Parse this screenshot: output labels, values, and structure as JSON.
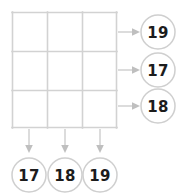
{
  "puzzle": {
    "grid": {
      "rows": 3,
      "columns": 3,
      "cells": [
        [
          {
            "value": ""
          },
          {
            "value": ""
          },
          {
            "value": ""
          }
        ],
        [
          {
            "value": ""
          },
          {
            "value": ""
          },
          {
            "value": ""
          }
        ],
        [
          {
            "value": ""
          },
          {
            "value": ""
          },
          {
            "value": ""
          }
        ]
      ],
      "line_color": "#d2d2d2",
      "cell_fill": "#ffffff"
    },
    "row_clues": [
      {
        "label": "19",
        "row_index": 0,
        "arrow": "arrow-right-icon"
      },
      {
        "label": "17",
        "row_index": 1,
        "arrow": "arrow-right-icon"
      },
      {
        "label": "18",
        "row_index": 2,
        "arrow": "arrow-right-icon"
      }
    ],
    "column_clues": [
      {
        "label": "17",
        "column_index": 0,
        "arrow": "arrow-down-icon"
      },
      {
        "label": "18",
        "column_index": 1,
        "arrow": "arrow-down-icon"
      },
      {
        "label": "19",
        "column_index": 2,
        "arrow": "arrow-down-icon"
      }
    ],
    "colors": {
      "line": "#d2d2d2",
      "arrow": "#c9c9c9",
      "bubble_stroke": "#cfcfcf",
      "bubble_fill": "#ffffff",
      "digit": "#1c1c1c",
      "background": "#ffffff"
    }
  }
}
